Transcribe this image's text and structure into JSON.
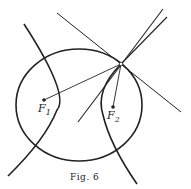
{
  "figure": {
    "caption": "Fig. 6",
    "labels": {
      "focus1": "F",
      "focus1_sub": "1",
      "focus2": "F",
      "focus2_sub": "2"
    },
    "elements": [
      "ellipse with foci F1 and F2",
      "hyperbola (two branches) with same foci",
      "intersection point of ellipse and hyperbola",
      "focal radii from F1 and F2 to intersection point",
      "tangent line to ellipse at intersection",
      "tangent line to hyperbola at intersection"
    ],
    "stroke_color": "#222222"
  }
}
